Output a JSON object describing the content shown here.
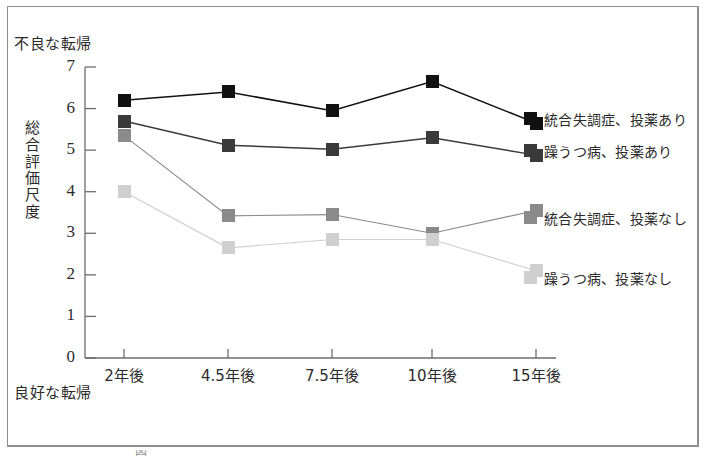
{
  "figure": {
    "top_anchor": "不良な転帰",
    "bottom_anchor": "良好な転帰",
    "y_axis_title": "総合評価尺度",
    "y_axis_title_chars": [
      "総",
      "合",
      "評",
      "価",
      "尺",
      "度"
    ]
  },
  "chart_data": {
    "type": "line",
    "title": "",
    "xlabel": "",
    "ylabel": "総合評価尺度",
    "categories": [
      "2年後",
      "4.5年後",
      "7.5年後",
      "10年後",
      "15年後"
    ],
    "yticks": [
      0,
      1,
      2,
      3,
      4,
      5,
      6,
      7
    ],
    "ylim": [
      0,
      7
    ],
    "grid": false,
    "legend_position": "right",
    "axis_annotations": {
      "y_top": "不良な転帰",
      "y_bottom": "良好な転帰"
    },
    "series": [
      {
        "name": "統合失調症、投薬あり",
        "color": "#111111",
        "values": [
          6.2,
          6.4,
          5.95,
          6.65,
          5.65
        ]
      },
      {
        "name": "躁うつ病、投薬あり",
        "color": "#3a3a3a",
        "values": [
          5.7,
          5.12,
          5.02,
          5.3,
          4.88
        ]
      },
      {
        "name": "統合失調症、投薬なし",
        "color": "#8a8a8a",
        "values": [
          5.35,
          3.42,
          3.45,
          3.0,
          3.55
        ]
      },
      {
        "name": "躁うつ病、投薬なし",
        "color": "#cfcfcf",
        "values": [
          4.0,
          2.65,
          2.85,
          2.85,
          2.1
        ]
      }
    ]
  },
  "caption": {
    "text": "図"
  }
}
